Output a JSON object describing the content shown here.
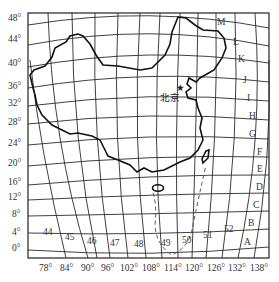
{
  "map": {
    "capital": {
      "label": "北京",
      "marker": "star-icon"
    },
    "latitude_labels": [
      "48°",
      "44°",
      "40°",
      "36°",
      "32°",
      "28°",
      "24°",
      "20°",
      "16°",
      "12°",
      "8°",
      "4°",
      "0°"
    ],
    "longitude_labels": [
      "78°",
      "84°",
      "90°",
      "96°",
      "102°",
      "108°",
      "114°",
      "120°",
      "126°",
      "132°",
      "138°"
    ],
    "zone_numbers": [
      "44",
      "45",
      "46",
      "47",
      "48",
      "49",
      "50",
      "51",
      "52"
    ],
    "row_letters": [
      "M",
      "L",
      "K",
      "J",
      "I",
      "H",
      "G",
      "F",
      "E",
      "D",
      "C",
      "B",
      "A"
    ]
  }
}
